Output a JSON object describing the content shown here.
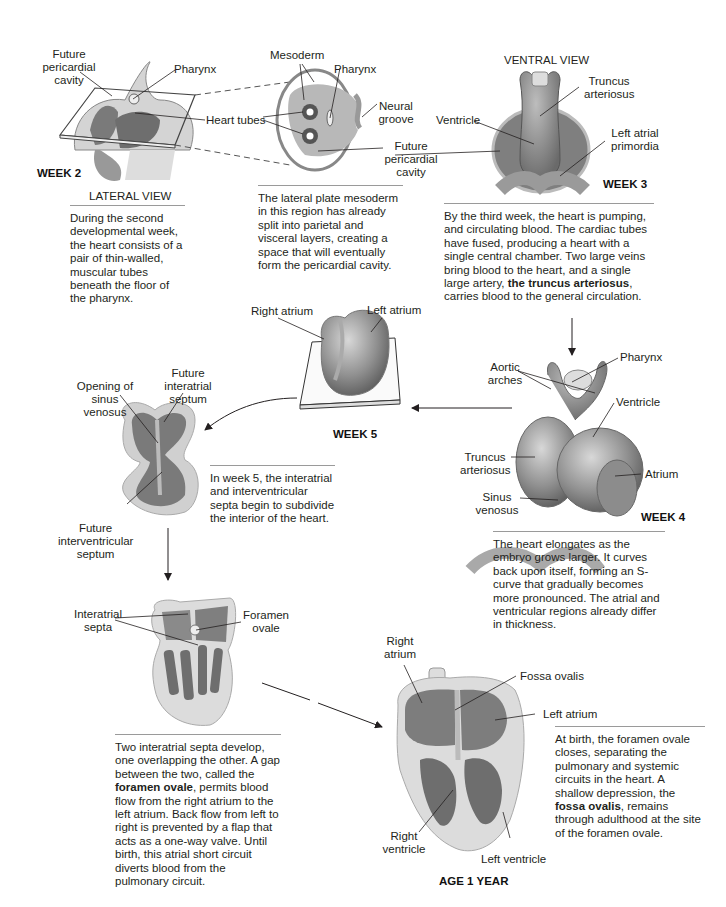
{
  "figure": {
    "stages": {
      "week2": {
        "stage_label": "WEEK 2",
        "view_label": "LATERAL VIEW",
        "labels": [
          "Future pericardial cavity",
          "Pharynx",
          "Heart tubes"
        ],
        "caption": "During the second developmental week, the heart consists of a pair of thin-walled, muscular tubes beneath the floor of the pharynx."
      },
      "week2_section": {
        "labels": [
          "Mesoderm",
          "Pharynx",
          "Neural groove",
          "Future pericardial cavity"
        ],
        "caption": "The lateral plate mesoderm in this region has already split into parietal and visceral layers, creating a space that will eventually form the pericardial cavity."
      },
      "week3": {
        "stage_label": "WEEK 3",
        "view_label": "VENTRAL VIEW",
        "labels": [
          "Truncus arteriosus",
          "Ventricle",
          "Left atrial primordia"
        ],
        "caption_pre": "By the third week, the heart is pumping, and circulating blood. The cardiac tubes have fused, producing a heart with a single central chamber. Two large veins bring blood to the heart, and a single large artery, ",
        "caption_bold": "the truncus arteriosus",
        "caption_post": ", carries blood to the general circulation."
      },
      "week4": {
        "stage_label": "WEEK 4",
        "labels": [
          "Aortic arches",
          "Pharynx",
          "Ventricle",
          "Truncus arteriosus",
          "Atrium",
          "Sinus venosus"
        ],
        "caption": "The heart elongates as the embryo grows larger. It curves back upon itself, forming an S-curve that gradually becomes more pronounced. The atrial and ventricular regions already differ in thickness."
      },
      "week5": {
        "stage_label": "WEEK 5",
        "labels": [
          "Right atrium",
          "Left atrium"
        ],
        "section_labels": [
          "Opening of sinus venosus",
          "Future interatrial septum",
          "Future interventricular septum"
        ],
        "caption": "In week 5, the interatrial and interventricular septa begin to subdivide the interior of the heart."
      },
      "fetal": {
        "labels": [
          "Interatrial septa",
          "Foramen ovale"
        ],
        "caption_pre": "Two interatrial septa develop, one overlapping the other. A gap between the two, called the ",
        "caption_bold": "foramen ovale",
        "caption_post": ", permits blood flow from the right atrium to the left atrium. Back flow from left to right is prevented by a flap that acts as a one-way valve. Until birth, this atrial short circuit diverts blood from the pulmonary circuit."
      },
      "age1": {
        "stage_label": "AGE 1 YEAR",
        "labels": [
          "Right atrium",
          "Fossa ovalis",
          "Left atrium",
          "Right ventricle",
          "Left ventricle"
        ],
        "caption_pre": "At birth, the foramen ovale closes, separating the pulmonary and systemic circuits in the heart. A shallow depression, the ",
        "caption_bold": "fossa ovalis",
        "caption_post": ", remains through adulthood at the site of the foramen ovale."
      }
    },
    "colors": {
      "tissue": "#8a8a8a",
      "tissue_light": "#c9c9c9",
      "line": "#231f20",
      "rule": "#9a9a9a"
    }
  }
}
